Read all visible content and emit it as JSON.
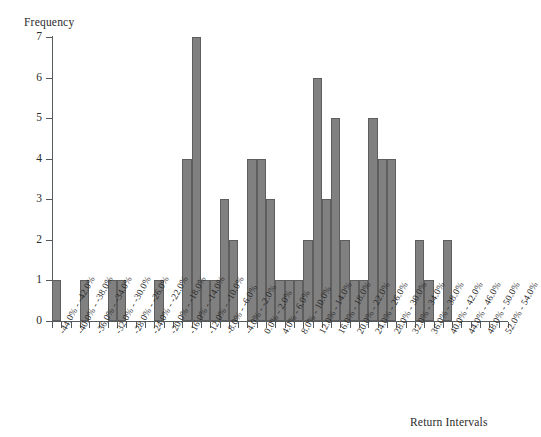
{
  "chart_data": {
    "type": "bar",
    "title": "",
    "subtitle": "",
    "xlabel": "Return Intervals",
    "ylabel": "Frequency",
    "ylim": [
      0,
      7
    ],
    "ytick_labels": [
      "0",
      "1",
      "2",
      "3",
      "4",
      "5",
      "6",
      "7"
    ],
    "ytick_values": [
      0,
      1,
      2,
      3,
      4,
      5,
      6,
      7
    ],
    "grid": false,
    "legend": null,
    "bar_color": "#808080",
    "bar_edge_color": "#5e5e5e",
    "axis_color": "#555a5c",
    "background_color": "#ffffff",
    "bin_width_percent": 2,
    "categories": [
      "-44.0% - -42.0%",
      "-42.0% - -40.0%",
      "-40.0% - -38.0%",
      "-38.0% - -36.0%",
      "-36.0% - -34.0%",
      "-34.0% - -32.0%",
      "-32.0% - -30.0%",
      "-30.0% - -28.0%",
      "-28.0% - -26.0%",
      "-26.0% - -24.0%",
      "-24.0% - -22.0%",
      "-22.0% - -20.0%",
      "-20.0% - -18.0%",
      "-18.0% - -16.0%",
      "-16.0% - -14.0%",
      "-14.0% - -12.0%",
      "-12.0% - -10.0%",
      "-10.0% - -8.0%",
      "-8.0% - -6.0%",
      "-6.0% - -4.0%",
      "-4.0% - -2.0%",
      "-2.0% - 0.0%",
      "0.0% - 2.0%",
      "2.0% - 4.0%",
      "4.0% - 6.0%",
      "6.0% - 8.0%",
      "8.0% - 10.0%",
      "10.0% - 12.0%",
      "12.0% - 14.0%",
      "14.0% - 16.0%",
      "16.0% - 18.0%",
      "18.0% - 20.0%",
      "20.0% - 22.0%",
      "22.0% - 24.0%",
      "24.0% - 26.0%",
      "26.0% - 28.0%",
      "28.0% - 30.0%",
      "30.0% - 32.0%",
      "32.0% - 34.0%",
      "34.0% - 36.0%",
      "36.0% - 38.0%",
      "38.0% - 40.0%",
      "40.0% - 42.0%",
      "42.0% - 44.0%",
      "44.0% - 46.0%",
      "46.0% - 48.0%",
      "48.0% - 50.0%",
      "50.0% - 52.0%",
      "52.0% - 54.0%"
    ],
    "values": [
      1,
      0,
      0,
      1,
      0,
      0,
      1,
      1,
      0,
      0,
      0,
      1,
      0,
      0,
      4,
      7,
      1,
      1,
      3,
      2,
      0,
      4,
      4,
      3,
      1,
      1,
      1,
      2,
      6,
      3,
      5,
      2,
      1,
      1,
      5,
      4,
      4,
      0,
      0,
      2,
      1,
      0,
      2,
      0,
      0,
      0,
      0,
      0,
      0
    ],
    "axis_tick_labels": [
      "-44.0% - -42.0%",
      "-42.0% - -40.0%",
      "-40.0% - -38.0%",
      "-38.0% - -36.0%",
      "-36.0% - -34.0%",
      "-34.0% - -32.0%",
      "-32.0% - -30.0%",
      "-30.0% - -28.0%",
      "-28.0% - -26.0%",
      "-26.0% - -24.0%",
      "-24.0% - -22.0%",
      "-22.0% - -20.0%",
      "-20.0% - -18.0%",
      "-18.0% - -16.0%",
      "-16.0% - -14.0%",
      "-14.0% - -12.0%",
      "-12.0% - -10.0%",
      "-10.0% - -8.0%",
      "-8.0% - -6.0%",
      "-6.0% - -4.0%",
      "-4.0% - -2.0%",
      "-2.0% - 0.0%",
      "0.0% - 2.0%",
      "2.0% - 4.0%",
      "4.0% - 6.0%",
      "6.0% - 8.0%",
      "8.0% - 10.0%",
      "10.0% - 12.0%",
      "12.0% - 14.0%",
      "14.0% - 16.0%",
      "16.0% - 18.0%",
      "18.0% - 20.0%",
      "20.0% - 22.0%",
      "22.0% - 24.0%",
      "24.0% - 26.0%",
      "26.0% - 28.0%",
      "28.0% - 30.0%",
      "30.0% - 32.0%",
      "32.0% - 34.0%",
      "34.0% - 36.0%",
      "36.0% - 38.0%",
      "38.0% - 40.0%",
      "40.0% - 42.0%",
      "42.0% - 44.0%",
      "44.0% - 46.0%",
      "46.0% - 48.0%",
      "48.0% - 50.0%",
      "50.0% - 52.0%",
      "52.0% - 54.0%"
    ],
    "displayed_x_labels": [
      "-44.0% - -42.0%",
      "-40.0% - -38.0%",
      "-36.0% - -34.0%",
      "-32.0% - -30.0%",
      "-28.0% - -26.0%",
      "-24.0% - -22.0%",
      "-20.0% - -18.0%",
      "-16.0% - -14.0%",
      "-12.0% - -10.0%",
      "-8.0% - -6.0%",
      "-4.0% - -2.0%",
      "0.0% - 2.0%",
      "4.0% - 6.0%",
      "8.0% - 10.0%",
      "12.0% - 14.0%",
      "16.0% - 18.0%",
      "20.0% - 22.0%",
      "24.0% - 26.0%",
      "28.0% - 30.0%",
      "32.0% - 34.0%",
      "36.0% - 38.0%",
      "40.0% - 42.0%",
      "44.0% - 46.0%",
      "48.0% - 50.0%",
      "52.0% - 54.0%"
    ]
  }
}
